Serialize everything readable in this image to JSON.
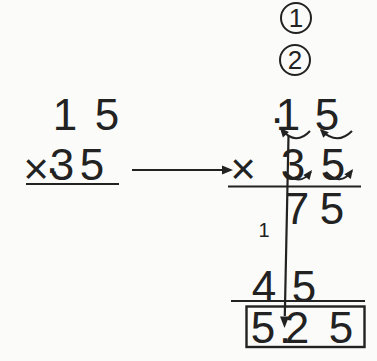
{
  "colors": {
    "ink": "#222222",
    "background": "#fbfbf9"
  },
  "badges": {
    "step_1": "1",
    "step_2": "2"
  },
  "left_problem": {
    "multiplicand_digits": [
      "1",
      "5"
    ],
    "times_sign": "×",
    "decimal_point": ".",
    "multiplier_digits": [
      "3",
      "5"
    ]
  },
  "right_problem": {
    "decimal_point": ".",
    "multiplicand_digits": [
      "1",
      "5"
    ],
    "times_sign": "×",
    "multiplier_digits": [
      "3",
      "5"
    ],
    "partial_product_1": [
      "7",
      "5"
    ],
    "carry": "1",
    "partial_product_2": [
      "4",
      "5"
    ],
    "product_digits": [
      "5",
      ".",
      "2",
      "5"
    ]
  }
}
